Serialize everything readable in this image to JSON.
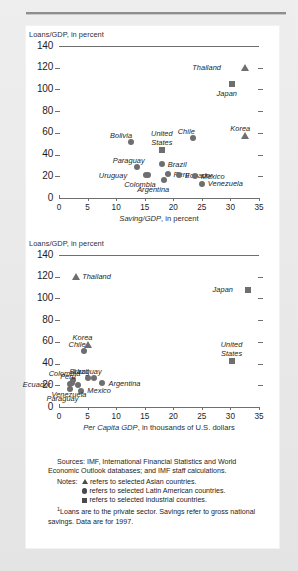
{
  "figure": {
    "background_color": "#e9e9e9",
    "panel_color": "#ffffff",
    "marker_color": "#6e6e6e"
  },
  "notes": {
    "sources_label": "Sources:",
    "sources_text": "IMF, International Financial Statistics and World Economic Outlook databases; and IMF staff calculations.",
    "notes_label": "Notes:",
    "legend": [
      {
        "glyph": "triangle",
        "text": "refers to selected Asian countries."
      },
      {
        "glyph": "circle",
        "text": "refers to selected Latin American countries."
      },
      {
        "glyph": "square",
        "text": "refers to selected industrial countries."
      }
    ],
    "footnote_marker": "1",
    "footnote_text": "Loans are to the private sector. Savings refer to gross national savings. Data are for 1997."
  },
  "chart_data": [
    {
      "type": "scatter",
      "title": "",
      "ylabel": "Loans/GDP, in percent",
      "xlabel": "Saving/GDP, in percent",
      "xlabel_prefix": "Saving/GDP",
      "xlabel_suffix": ", in percent",
      "xlim": [
        0,
        35
      ],
      "ylim": [
        0,
        140
      ],
      "xticks": [
        0,
        5,
        10,
        15,
        20,
        25,
        30,
        35
      ],
      "yticks": [
        0,
        20,
        40,
        60,
        80,
        100,
        120,
        140
      ],
      "grid": false,
      "legend_position": "none",
      "series": [
        {
          "name": "selected Asian countries",
          "marker": "triangle",
          "points": [
            {
              "label": "Thailand",
              "x": 32.6,
              "y": 120,
              "label_pos": "left"
            },
            {
              "label": "Korea",
              "x": 32.6,
              "y": 58,
              "label_pos": "above"
            }
          ]
        },
        {
          "name": "selected industrial countries",
          "marker": "square",
          "points": [
            {
              "label": "Japan",
              "x": 30.2,
              "y": 105,
              "label_pos": "below"
            },
            {
              "label": "United States",
              "x": 18.0,
              "y": 44,
              "label_pos": "above"
            }
          ]
        },
        {
          "name": "selected Latin American countries",
          "marker": "circle",
          "points": [
            {
              "label": "Bolivia",
              "x": 12.6,
              "y": 52,
              "label_pos": "above"
            },
            {
              "label": "Chile",
              "x": 23.4,
              "y": 55,
              "label_pos": "above"
            },
            {
              "label": "Paraguay",
              "x": 13.6,
              "y": 29,
              "label_pos": "above"
            },
            {
              "label": "Brazil",
              "x": 18.0,
              "y": 31,
              "label_pos": "right"
            },
            {
              "label": "Uruguay",
              "x": 15.2,
              "y": 21,
              "label_pos": "left"
            },
            {
              "label": "Colombia",
              "x": 15.6,
              "y": 21,
              "label_pos": "below"
            },
            {
              "label": "Peru",
              "x": 19.0,
              "y": 22,
              "label_pos": "right"
            },
            {
              "label": "Argentina",
              "x": 18.4,
              "y": 17,
              "label_pos": "below"
            },
            {
              "label": "Ecuador",
              "x": 21.0,
              "y": 21,
              "label_pos": "right"
            },
            {
              "label": "Mexico",
              "x": 23.8,
              "y": 20,
              "label_pos": "right"
            },
            {
              "label": "Venezuela",
              "x": 25.0,
              "y": 13,
              "label_pos": "right"
            }
          ]
        }
      ]
    },
    {
      "type": "scatter",
      "title": "",
      "ylabel": "Loans/GDP, in percent",
      "xlabel": "Per Capita GDP, in thousands of U.S. dollars",
      "xlabel_prefix": "Per Capita GDP",
      "xlabel_suffix": ", in thousands of U.S. dollars",
      "xlim": [
        0,
        35
      ],
      "ylim": [
        0,
        140
      ],
      "xticks": [
        0,
        5,
        10,
        15,
        20,
        25,
        30,
        35
      ],
      "yticks": [
        0,
        20,
        40,
        60,
        80,
        100,
        120,
        140
      ],
      "grid": false,
      "legend_position": "none",
      "series": [
        {
          "name": "selected Asian countries",
          "marker": "triangle",
          "points": [
            {
              "label": "Thailand",
              "x": 3.0,
              "y": 120,
              "label_pos": "right"
            },
            {
              "label": "Korea",
              "x": 5.0,
              "y": 58,
              "label_pos": "above"
            }
          ]
        },
        {
          "name": "selected industrial countries",
          "marker": "square",
          "points": [
            {
              "label": "Japan",
              "x": 33.0,
              "y": 108,
              "label_pos": "left"
            },
            {
              "label": "United States",
              "x": 30.2,
              "y": 42,
              "label_pos": "above"
            }
          ]
        },
        {
          "name": "selected Latin American countries",
          "marker": "circle",
          "points": [
            {
              "label": "Chile",
              "x": 4.3,
              "y": 52,
              "label_pos": "above"
            },
            {
              "label": "Colombia",
              "x": 2.4,
              "y": 25,
              "label_pos": "above"
            },
            {
              "label": "Peru",
              "x": 2.3,
              "y": 22,
              "label_pos": "above"
            },
            {
              "label": "Ecuador",
              "x": 1.9,
              "y": 21,
              "label_pos": "left"
            },
            {
              "label": "Brazil",
              "x": 5.0,
              "y": 27,
              "label_pos": "above"
            },
            {
              "label": "Uruguay",
              "x": 6.2,
              "y": 27,
              "label_pos": "above"
            },
            {
              "label": "Argentina",
              "x": 7.6,
              "y": 22,
              "label_pos": "right"
            },
            {
              "label": "Paraguay",
              "x": 2.0,
              "y": 17,
              "label_pos": "below"
            },
            {
              "label": "Mexico",
              "x": 3.9,
              "y": 15,
              "label_pos": "right"
            },
            {
              "label": "Venezuela",
              "x": 3.4,
              "y": 20,
              "label_pos": "below"
            }
          ]
        }
      ]
    }
  ]
}
